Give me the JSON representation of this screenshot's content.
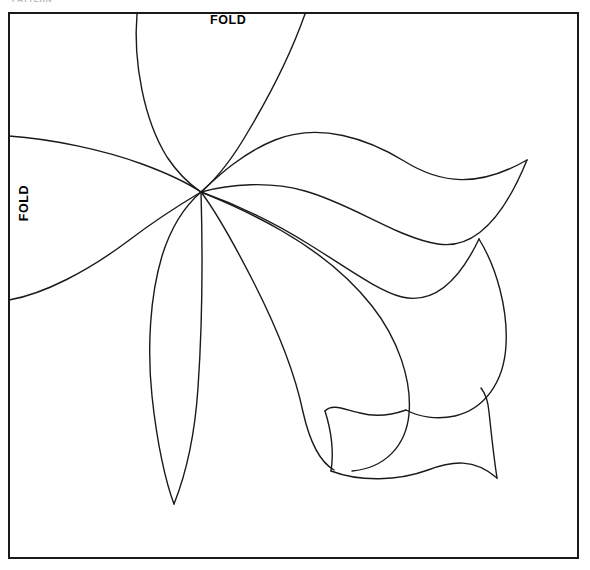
{
  "page": {
    "background_color": "#ffffff",
    "line_color": "#1a1a1a",
    "width": 590,
    "height": 570
  },
  "clipped_header_text": "PATTERN",
  "frame": {
    "name": "pattern-border-box",
    "x": 9,
    "y": 13,
    "width": 569,
    "height": 545,
    "stroke": "#1a1a1a",
    "stroke_width": 2
  },
  "labels": {
    "fold_top": "FOLD",
    "fold_left": "FOLD"
  },
  "drawing": {
    "name": "flower-applique-outline",
    "description": "Five-lobed flower / leaf appliqué outline radiating from a single convergence point",
    "convergence_point": {
      "x": 201,
      "y": 192
    },
    "paths": {
      "top_petal_left_edge": "M 137 14 C 134 70 160 150 201 192",
      "top_petal_right_edge": "M 201 192 C 247 152 284 80 305 14",
      "left_petal_upper_edge": "M 9 137 C 70 140 150 165 201 192",
      "left_petal_lower_edge": "M 201 192 C 150 225 70 285 9 300",
      "right_petal_upper_edge": "M 201 192 C 235 140 300 126 350 138 C 410 152 448 200 525 160",
      "right_petal_lower_edge": "M 201 192 C 250 181 310 190 370 215 C 430 240 470 215 525 160",
      "inner_petal_upper_edge": "M 201 192 C 270 193 330 245 385 300 C 420 334 430 408 405 452 C 380 492 310 500 262 470 C 215 440 196 390 200 330",
      "lower_lobe_edge": "M 201 192 C 212 215 225 280 240 340 C 252 390 255 440 262 470",
      "narrow_leaf_outer_edge": "M 201 192 C 180 215 160 260 152 320 C 145 380 152 450 174 504",
      "narrow_leaf_inner_edge": "M 174 504 C 193 448 198 385 198 330 C 198 275 200 230 201 192",
      "big_petal_top_edge": "M 201 192 C 260 215 320 255 372 288 C 412 313 450 318 474 240",
      "big_petal_right_lobe": "M 474 240 C 500 290 505 355 475 390 C 452 416 420 418 398 404",
      "big_petal_notch": "M 398 404 C 380 398 362 396 350 398 C 360 420 366 450 362 470",
      "big_petal_bottom_edge": "M 362 470 C 410 482 455 480 497 478",
      "big_petal_tail": "M 497 478 C 490 440 486 420 480 404"
    }
  }
}
